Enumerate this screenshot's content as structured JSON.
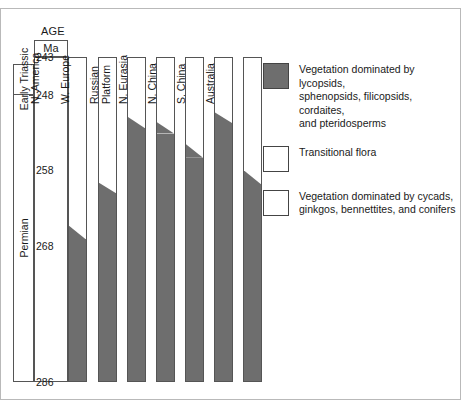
{
  "chart_data": {
    "type": "area",
    "title": "",
    "xlabel": "",
    "ylabel": "AGE",
    "ylabel_unit": "Ma",
    "ylim": [
      286,
      243
    ],
    "grid": false,
    "legend_position": "right",
    "axis_ticks": [
      243,
      248,
      258,
      268,
      286
    ],
    "periods": [
      {
        "name": "Early  Triassic",
        "from": 243,
        "to": 248
      },
      {
        "name": "Permian",
        "from": 248,
        "to": 286
      }
    ],
    "categories": [
      "N. America",
      "W. Europe",
      "Russian\nPlatform",
      "N. Eurasia",
      "N. China",
      "S. China",
      "Australia"
    ],
    "flora_classes": [
      {
        "key": "lycopsid",
        "fill": "dark"
      },
      {
        "key": "transitional",
        "fill": "stipple"
      },
      {
        "key": "cycad",
        "fill": "white"
      }
    ],
    "series": [
      {
        "name": "N. America",
        "white_to_transitional_ma": [
          256.6,
          257.8
        ],
        "transitional_to_lycopsid_ma": [
          265.2,
          267.0
        ]
      },
      {
        "name": "W. Europe",
        "white_to_transitional_ma": [
          252.9,
          254.4
        ],
        "transitional_to_lycopsid_ma": [
          259.5,
          260.9
        ]
      },
      {
        "name": "Russian Platform",
        "white_to_transitional_ma": [
          246.4,
          247.8
        ],
        "transitional_to_lycopsid_ma": [
          250.8,
          252.3
        ]
      },
      {
        "name": "N. Eurasia",
        "white_to_transitional_ma": [
          247.0,
          248.3
        ],
        "transitional_to_lycopsid_ma": [
          251.5,
          253.0
        ]
      },
      {
        "name": "N. China",
        "white_to_transitional_ma": [
          243.9,
          245.4
        ],
        "transitional_to_lycopsid_ma": [
          254.4,
          256.2
        ]
      },
      {
        "name": "S. China",
        "white_to_transitional_ma": [
          248.0,
          249.2
        ],
        "transitional_to_lycopsid_ma": [
          250.2,
          251.6
        ]
      },
      {
        "name": "Australia",
        "white_to_transitional_ma": [
          246.7,
          248.3
        ],
        "transitional_to_lycopsid_ma": [
          257.9,
          259.7
        ]
      }
    ]
  },
  "axis": {
    "age_header": "AGE",
    "unit_header": "Ma",
    "ticks": [
      "243",
      "248",
      "258",
      "268",
      "286"
    ],
    "periods": [
      "Early  Triassic",
      "Permian"
    ]
  },
  "columns": [
    {
      "label": "N. America"
    },
    {
      "label": "W. Europe"
    },
    {
      "label": "Russian\nPlatform"
    },
    {
      "label": "N. Eurasia"
    },
    {
      "label": "N. China"
    },
    {
      "label": "S. China"
    },
    {
      "label": "Australia"
    }
  ],
  "legend": {
    "items": [
      {
        "swatch": "dark",
        "text": "Vegetation dominated by lycopsids,\nsphenopsids, filicopsids, cordaites,\nand pteridosperms"
      },
      {
        "swatch": "stipple",
        "text": "Transitional flora"
      },
      {
        "swatch": "white",
        "text": "Vegetation dominated by cycads,\nginkgos, bennettites, and conifers"
      }
    ]
  },
  "colors": {
    "lycopsid_fill": "#6e6e6e",
    "stipple_dot": "#767676",
    "cycad_fill": "#ffffff",
    "stroke": "#555555",
    "frame": "#b9b9b9"
  }
}
